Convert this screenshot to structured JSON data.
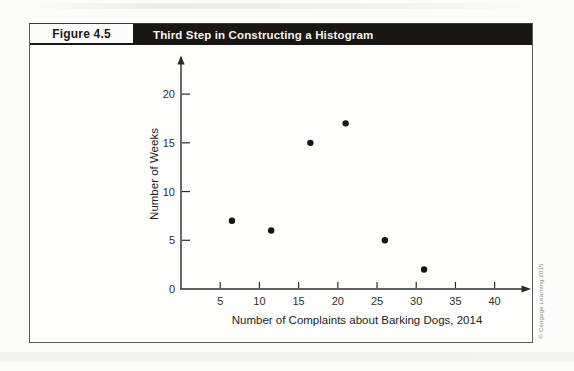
{
  "figure": {
    "label": "Figure 4.5",
    "title": "Third Step in Constructing a Histogram"
  },
  "credit": "© Cengage Learning 2015",
  "colors": {
    "title_bar_bg": "#1a1613",
    "title_text": "#f5f3ec",
    "frame_border": "#5a5a58",
    "axis": "#2b2b2b",
    "tick_label": "#2e2e2e",
    "dot": "#141414",
    "credit_text": "#8b8b87"
  },
  "chart_data": {
    "type": "scatter",
    "title": "Third Step in Constructing a Histogram",
    "xlabel": "Number of Complaints about Barking Dogs, 2014",
    "ylabel": "Number of Weeks",
    "points": [
      {
        "x": 6.5,
        "y": 7
      },
      {
        "x": 11.5,
        "y": 6
      },
      {
        "x": 16.5,
        "y": 15
      },
      {
        "x": 21,
        "y": 17
      },
      {
        "x": 26,
        "y": 5
      },
      {
        "x": 31,
        "y": 2
      }
    ],
    "x_ticks": [
      5,
      10,
      15,
      20,
      25,
      30,
      35,
      40
    ],
    "y_ticks": [
      0,
      5,
      10,
      15,
      20
    ],
    "xlim": [
      0,
      44
    ],
    "ylim": [
      0,
      23.5
    ],
    "grid": false,
    "legend": null,
    "marker": "filled-circle"
  }
}
